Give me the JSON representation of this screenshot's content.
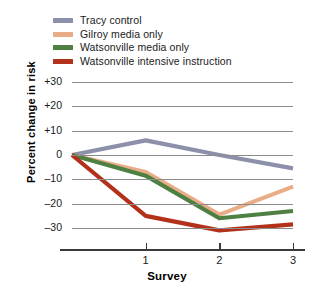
{
  "chart_data": {
    "type": "line",
    "title": "",
    "xlabel": "Survey",
    "ylabel": "Percent change in risk",
    "x": [
      0,
      1,
      2,
      3
    ],
    "xtick_labels": [
      "1",
      "2",
      "3"
    ],
    "xticks": [
      1,
      2,
      3
    ],
    "ytick_labels": [
      "+30",
      "+20",
      "+10",
      "0",
      "–10",
      "–20",
      "–30"
    ],
    "yticks": [
      30,
      20,
      10,
      0,
      -10,
      -20,
      -30
    ],
    "ylim": [
      -36,
      34
    ],
    "xlim": [
      -0.12,
      3.25
    ],
    "grid": "horizontal",
    "legend_position": "above-plot-left",
    "series": [
      {
        "name": "Tracy control",
        "color": "#8d90ab",
        "values": [
          0,
          6,
          0,
          -5.5
        ]
      },
      {
        "name": "Gilroy media only",
        "color": "#e8ad86",
        "values": [
          0,
          -7,
          -24.5,
          -13
        ]
      },
      {
        "name": "Watsonville media only",
        "color": "#4e8043",
        "values": [
          0,
          -8.5,
          -26,
          -23
        ]
      },
      {
        "name": "Watsonville intensive instruction",
        "color": "#b3301a",
        "values": [
          0,
          -25,
          -31,
          -28.5
        ]
      }
    ]
  },
  "legend": {
    "items": [
      {
        "label": "Tracy control",
        "color": "#8d90ab"
      },
      {
        "label": "Gilroy media only",
        "color": "#e8ad86"
      },
      {
        "label": "Watsonville media only",
        "color": "#4e8043"
      },
      {
        "label": "Watsonville intensive instruction",
        "color": "#b3301a"
      }
    ]
  }
}
